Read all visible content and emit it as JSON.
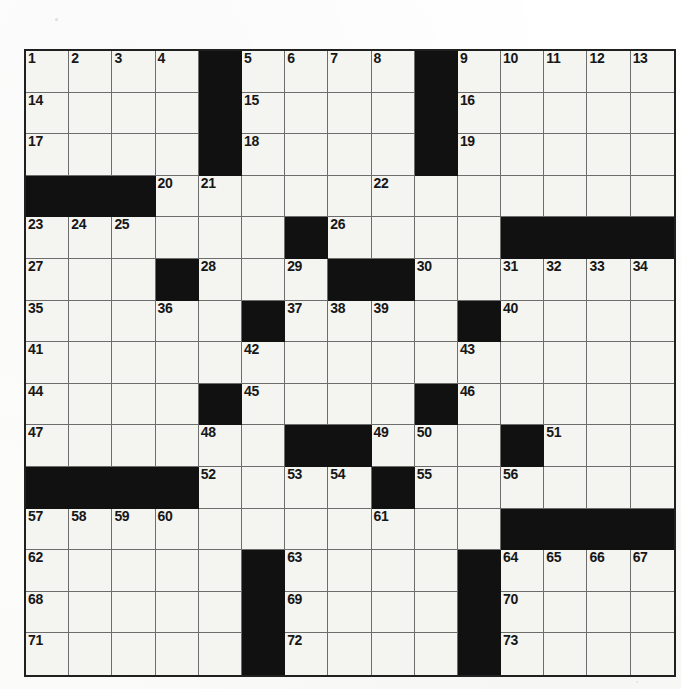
{
  "puzzle": {
    "kind": "crossword-grid",
    "rows": 15,
    "columns": 15,
    "cell_fill_color": "#f4f4f1",
    "block_color": "#111111",
    "grid_line_color": "#6d6d6d",
    "border_color": "#202020",
    "number_color": "#171717",
    "layout": [
      [
        {
          "block": false,
          "num": "1"
        },
        {
          "block": false,
          "num": "2"
        },
        {
          "block": false,
          "num": "3"
        },
        {
          "block": false,
          "num": "4"
        },
        {
          "block": true,
          "num": ""
        },
        {
          "block": false,
          "num": "5"
        },
        {
          "block": false,
          "num": "6"
        },
        {
          "block": false,
          "num": "7"
        },
        {
          "block": false,
          "num": "8"
        },
        {
          "block": true,
          "num": ""
        },
        {
          "block": false,
          "num": "9"
        },
        {
          "block": false,
          "num": "10"
        },
        {
          "block": false,
          "num": "11"
        },
        {
          "block": false,
          "num": "12"
        },
        {
          "block": false,
          "num": "13"
        }
      ],
      [
        {
          "block": false,
          "num": "14"
        },
        {
          "block": false,
          "num": ""
        },
        {
          "block": false,
          "num": ""
        },
        {
          "block": false,
          "num": ""
        },
        {
          "block": true,
          "num": ""
        },
        {
          "block": false,
          "num": "15"
        },
        {
          "block": false,
          "num": ""
        },
        {
          "block": false,
          "num": ""
        },
        {
          "block": false,
          "num": ""
        },
        {
          "block": true,
          "num": ""
        },
        {
          "block": false,
          "num": "16"
        },
        {
          "block": false,
          "num": ""
        },
        {
          "block": false,
          "num": ""
        },
        {
          "block": false,
          "num": ""
        },
        {
          "block": false,
          "num": ""
        }
      ],
      [
        {
          "block": false,
          "num": "17"
        },
        {
          "block": false,
          "num": ""
        },
        {
          "block": false,
          "num": ""
        },
        {
          "block": false,
          "num": ""
        },
        {
          "block": true,
          "num": ""
        },
        {
          "block": false,
          "num": "18"
        },
        {
          "block": false,
          "num": ""
        },
        {
          "block": false,
          "num": ""
        },
        {
          "block": false,
          "num": ""
        },
        {
          "block": true,
          "num": ""
        },
        {
          "block": false,
          "num": "19"
        },
        {
          "block": false,
          "num": ""
        },
        {
          "block": false,
          "num": ""
        },
        {
          "block": false,
          "num": ""
        },
        {
          "block": false,
          "num": ""
        }
      ],
      [
        {
          "block": true,
          "num": ""
        },
        {
          "block": true,
          "num": ""
        },
        {
          "block": true,
          "num": ""
        },
        {
          "block": false,
          "num": "20"
        },
        {
          "block": false,
          "num": "21"
        },
        {
          "block": false,
          "num": ""
        },
        {
          "block": false,
          "num": ""
        },
        {
          "block": false,
          "num": ""
        },
        {
          "block": false,
          "num": "22"
        },
        {
          "block": false,
          "num": ""
        },
        {
          "block": false,
          "num": ""
        },
        {
          "block": false,
          "num": ""
        },
        {
          "block": false,
          "num": ""
        },
        {
          "block": false,
          "num": ""
        },
        {
          "block": false,
          "num": ""
        }
      ],
      [
        {
          "block": false,
          "num": "23"
        },
        {
          "block": false,
          "num": "24"
        },
        {
          "block": false,
          "num": "25"
        },
        {
          "block": false,
          "num": ""
        },
        {
          "block": false,
          "num": ""
        },
        {
          "block": false,
          "num": ""
        },
        {
          "block": true,
          "num": ""
        },
        {
          "block": false,
          "num": "26"
        },
        {
          "block": false,
          "num": ""
        },
        {
          "block": false,
          "num": ""
        },
        {
          "block": false,
          "num": ""
        },
        {
          "block": true,
          "num": ""
        },
        {
          "block": true,
          "num": ""
        },
        {
          "block": true,
          "num": ""
        },
        {
          "block": true,
          "num": ""
        }
      ],
      [
        {
          "block": false,
          "num": "27"
        },
        {
          "block": false,
          "num": ""
        },
        {
          "block": false,
          "num": ""
        },
        {
          "block": true,
          "num": ""
        },
        {
          "block": false,
          "num": "28"
        },
        {
          "block": false,
          "num": ""
        },
        {
          "block": false,
          "num": "29"
        },
        {
          "block": true,
          "num": ""
        },
        {
          "block": true,
          "num": ""
        },
        {
          "block": false,
          "num": "30"
        },
        {
          "block": false,
          "num": ""
        },
        {
          "block": false,
          "num": "31"
        },
        {
          "block": false,
          "num": "32"
        },
        {
          "block": false,
          "num": "33"
        },
        {
          "block": false,
          "num": "34"
        }
      ],
      [
        {
          "block": false,
          "num": "35"
        },
        {
          "block": false,
          "num": ""
        },
        {
          "block": false,
          "num": ""
        },
        {
          "block": false,
          "num": "36"
        },
        {
          "block": false,
          "num": ""
        },
        {
          "block": true,
          "num": ""
        },
        {
          "block": false,
          "num": "37"
        },
        {
          "block": false,
          "num": "38"
        },
        {
          "block": false,
          "num": "39"
        },
        {
          "block": false,
          "num": ""
        },
        {
          "block": true,
          "num": ""
        },
        {
          "block": false,
          "num": "40"
        },
        {
          "block": false,
          "num": ""
        },
        {
          "block": false,
          "num": ""
        },
        {
          "block": false,
          "num": ""
        }
      ],
      [
        {
          "block": false,
          "num": "41"
        },
        {
          "block": false,
          "num": ""
        },
        {
          "block": false,
          "num": ""
        },
        {
          "block": false,
          "num": ""
        },
        {
          "block": false,
          "num": ""
        },
        {
          "block": false,
          "num": "42"
        },
        {
          "block": false,
          "num": ""
        },
        {
          "block": false,
          "num": ""
        },
        {
          "block": false,
          "num": ""
        },
        {
          "block": false,
          "num": ""
        },
        {
          "block": false,
          "num": "43"
        },
        {
          "block": false,
          "num": ""
        },
        {
          "block": false,
          "num": ""
        },
        {
          "block": false,
          "num": ""
        },
        {
          "block": false,
          "num": ""
        }
      ],
      [
        {
          "block": false,
          "num": "44"
        },
        {
          "block": false,
          "num": ""
        },
        {
          "block": false,
          "num": ""
        },
        {
          "block": false,
          "num": ""
        },
        {
          "block": true,
          "num": ""
        },
        {
          "block": false,
          "num": "45"
        },
        {
          "block": false,
          "num": ""
        },
        {
          "block": false,
          "num": ""
        },
        {
          "block": false,
          "num": ""
        },
        {
          "block": true,
          "num": ""
        },
        {
          "block": false,
          "num": "46"
        },
        {
          "block": false,
          "num": ""
        },
        {
          "block": false,
          "num": ""
        },
        {
          "block": false,
          "num": ""
        },
        {
          "block": false,
          "num": ""
        }
      ],
      [
        {
          "block": false,
          "num": "47"
        },
        {
          "block": false,
          "num": ""
        },
        {
          "block": false,
          "num": ""
        },
        {
          "block": false,
          "num": ""
        },
        {
          "block": false,
          "num": "48"
        },
        {
          "block": false,
          "num": ""
        },
        {
          "block": true,
          "num": ""
        },
        {
          "block": true,
          "num": ""
        },
        {
          "block": false,
          "num": "49"
        },
        {
          "block": false,
          "num": "50"
        },
        {
          "block": false,
          "num": ""
        },
        {
          "block": true,
          "num": ""
        },
        {
          "block": false,
          "num": "51"
        },
        {
          "block": false,
          "num": ""
        },
        {
          "block": false,
          "num": ""
        }
      ],
      [
        {
          "block": true,
          "num": ""
        },
        {
          "block": true,
          "num": ""
        },
        {
          "block": true,
          "num": ""
        },
        {
          "block": true,
          "num": ""
        },
        {
          "block": false,
          "num": "52"
        },
        {
          "block": false,
          "num": ""
        },
        {
          "block": false,
          "num": "53"
        },
        {
          "block": false,
          "num": "54"
        },
        {
          "block": true,
          "num": ""
        },
        {
          "block": false,
          "num": "55"
        },
        {
          "block": false,
          "num": ""
        },
        {
          "block": false,
          "num": "56"
        },
        {
          "block": false,
          "num": ""
        },
        {
          "block": false,
          "num": ""
        },
        {
          "block": false,
          "num": ""
        }
      ],
      [
        {
          "block": false,
          "num": "57"
        },
        {
          "block": false,
          "num": "58"
        },
        {
          "block": false,
          "num": "59"
        },
        {
          "block": false,
          "num": "60"
        },
        {
          "block": false,
          "num": ""
        },
        {
          "block": false,
          "num": ""
        },
        {
          "block": false,
          "num": ""
        },
        {
          "block": false,
          "num": ""
        },
        {
          "block": false,
          "num": "61"
        },
        {
          "block": false,
          "num": ""
        },
        {
          "block": false,
          "num": ""
        },
        {
          "block": true,
          "num": ""
        },
        {
          "block": true,
          "num": ""
        },
        {
          "block": true,
          "num": ""
        },
        {
          "block": true,
          "num": ""
        }
      ],
      [
        {
          "block": false,
          "num": "62"
        },
        {
          "block": false,
          "num": ""
        },
        {
          "block": false,
          "num": ""
        },
        {
          "block": false,
          "num": ""
        },
        {
          "block": false,
          "num": ""
        },
        {
          "block": true,
          "num": ""
        },
        {
          "block": false,
          "num": "63"
        },
        {
          "block": false,
          "num": ""
        },
        {
          "block": false,
          "num": ""
        },
        {
          "block": false,
          "num": ""
        },
        {
          "block": true,
          "num": ""
        },
        {
          "block": false,
          "num": "64"
        },
        {
          "block": false,
          "num": "65"
        },
        {
          "block": false,
          "num": "66"
        },
        {
          "block": false,
          "num": "67"
        }
      ],
      [
        {
          "block": false,
          "num": "68"
        },
        {
          "block": false,
          "num": ""
        },
        {
          "block": false,
          "num": ""
        },
        {
          "block": false,
          "num": ""
        },
        {
          "block": false,
          "num": ""
        },
        {
          "block": true,
          "num": ""
        },
        {
          "block": false,
          "num": "69"
        },
        {
          "block": false,
          "num": ""
        },
        {
          "block": false,
          "num": ""
        },
        {
          "block": false,
          "num": ""
        },
        {
          "block": true,
          "num": ""
        },
        {
          "block": false,
          "num": "70"
        },
        {
          "block": false,
          "num": ""
        },
        {
          "block": false,
          "num": ""
        },
        {
          "block": false,
          "num": ""
        }
      ],
      [
        {
          "block": false,
          "num": "71"
        },
        {
          "block": false,
          "num": ""
        },
        {
          "block": false,
          "num": ""
        },
        {
          "block": false,
          "num": ""
        },
        {
          "block": false,
          "num": ""
        },
        {
          "block": true,
          "num": ""
        },
        {
          "block": false,
          "num": "72"
        },
        {
          "block": false,
          "num": ""
        },
        {
          "block": false,
          "num": ""
        },
        {
          "block": false,
          "num": ""
        },
        {
          "block": true,
          "num": ""
        },
        {
          "block": false,
          "num": "73"
        },
        {
          "block": false,
          "num": ""
        },
        {
          "block": false,
          "num": ""
        },
        {
          "block": false,
          "num": ""
        }
      ]
    ]
  }
}
